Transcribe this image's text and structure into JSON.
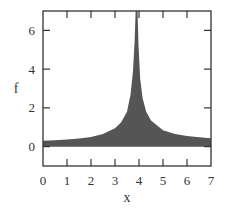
{
  "chart_data": {
    "type": "area",
    "title": "",
    "xlabel": "x",
    "ylabel": "f",
    "xlim": [
      0,
      7
    ],
    "ylim": [
      -1,
      7
    ],
    "xticks": [
      0,
      1,
      2,
      3,
      4,
      5,
      6,
      7
    ],
    "yticks": [
      0,
      2,
      4,
      6
    ],
    "grid": false,
    "legend": null,
    "fill_color": "#555555",
    "series": [
      {
        "name": "f",
        "x": [
          0,
          0.5,
          1,
          1.5,
          2,
          2.5,
          3,
          3.25,
          3.5,
          3.65,
          3.75,
          3.82,
          3.86,
          3.88,
          3.9,
          3.92,
          3.94,
          3.98,
          4.05,
          4.15,
          4.3,
          4.5,
          5,
          5.5,
          6,
          6.5,
          7
        ],
        "y": [
          0.3,
          0.33,
          0.37,
          0.42,
          0.5,
          0.65,
          0.95,
          1.25,
          1.8,
          2.7,
          3.9,
          5.5,
          7,
          7,
          7,
          7,
          7,
          5.2,
          3.5,
          2.5,
          1.8,
          1.35,
          0.85,
          0.65,
          0.55,
          0.48,
          0.43
        ]
      }
    ]
  }
}
